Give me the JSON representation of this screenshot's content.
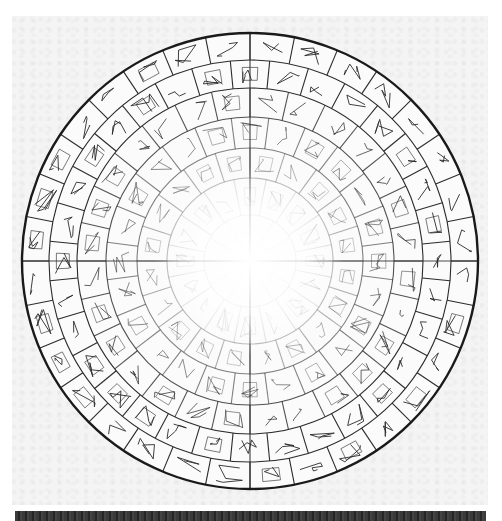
{
  "colors": {
    "background": "#ffffff",
    "paper": "#f4f4f4",
    "ink": "#2b2b2b",
    "outer_rim": "#1a1a1a",
    "center_glow": "#ffffff",
    "bottom_strip": "#333333"
  },
  "wheel": {
    "center": [
      250,
      261
    ],
    "outer_radius": 228,
    "rings": [
      {
        "outer": 228,
        "inner": 201,
        "segments": 32
      },
      {
        "outer": 201,
        "inner": 173,
        "segments": 32
      },
      {
        "outer": 173,
        "inner": 144,
        "segments": 28
      },
      {
        "outer": 144,
        "inner": 113,
        "segments": 24
      },
      {
        "outer": 113,
        "inner": 83,
        "segments": 20
      },
      {
        "outer": 83,
        "inner": 46,
        "segments": 16
      }
    ],
    "center_disc": {
      "radius": 46,
      "wedges": 12
    },
    "axis_lines": [
      "vertical",
      "horizontal"
    ],
    "fade_toward_center": true
  }
}
